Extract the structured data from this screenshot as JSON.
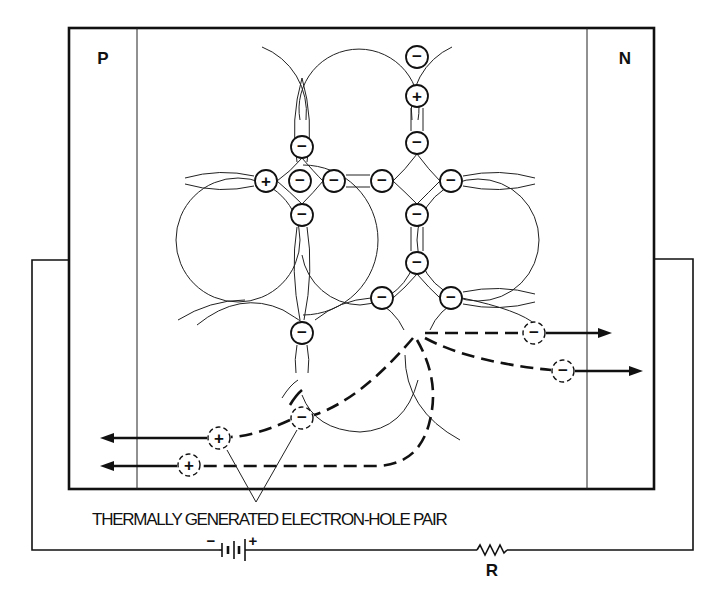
{
  "diagram": {
    "regions": {
      "p_label": "P",
      "n_label": "N"
    },
    "caption": "THERMALLY GENERATED ELECTRON-HOLE PAIR",
    "circuit": {
      "battery_minus": "−",
      "battery_plus": "+",
      "resistor_label": "R"
    },
    "symbols": {
      "electron": "−",
      "hole": "+"
    },
    "lattice_charges": [
      {
        "type": "electron",
        "x": 417,
        "y": 57
      },
      {
        "type": "hole",
        "x": 417,
        "y": 96
      },
      {
        "type": "electron",
        "x": 417,
        "y": 143
      },
      {
        "type": "electron",
        "x": 302,
        "y": 147
      },
      {
        "type": "hole",
        "x": 266,
        "y": 181
      },
      {
        "type": "electron",
        "x": 300,
        "y": 181
      },
      {
        "type": "electron",
        "x": 334,
        "y": 181
      },
      {
        "type": "electron",
        "x": 382,
        "y": 181
      },
      {
        "type": "electron",
        "x": 451,
        "y": 181
      },
      {
        "type": "electron",
        "x": 302,
        "y": 215
      },
      {
        "type": "electron",
        "x": 417,
        "y": 215
      },
      {
        "type": "electron",
        "x": 417,
        "y": 263
      },
      {
        "type": "electron",
        "x": 382,
        "y": 298
      },
      {
        "type": "electron",
        "x": 451,
        "y": 298
      },
      {
        "type": "electron",
        "x": 302,
        "y": 333
      }
    ],
    "free_carriers": [
      {
        "type": "electron",
        "x": 534,
        "y": 333,
        "direction": "toward N"
      },
      {
        "type": "electron",
        "x": 563,
        "y": 371,
        "direction": "toward N"
      },
      {
        "type": "electron",
        "x": 302,
        "y": 418,
        "direction": "generated pair"
      },
      {
        "type": "hole",
        "x": 219,
        "y": 438,
        "direction": "toward P"
      },
      {
        "type": "hole",
        "x": 189,
        "y": 465,
        "direction": "toward P"
      }
    ]
  }
}
